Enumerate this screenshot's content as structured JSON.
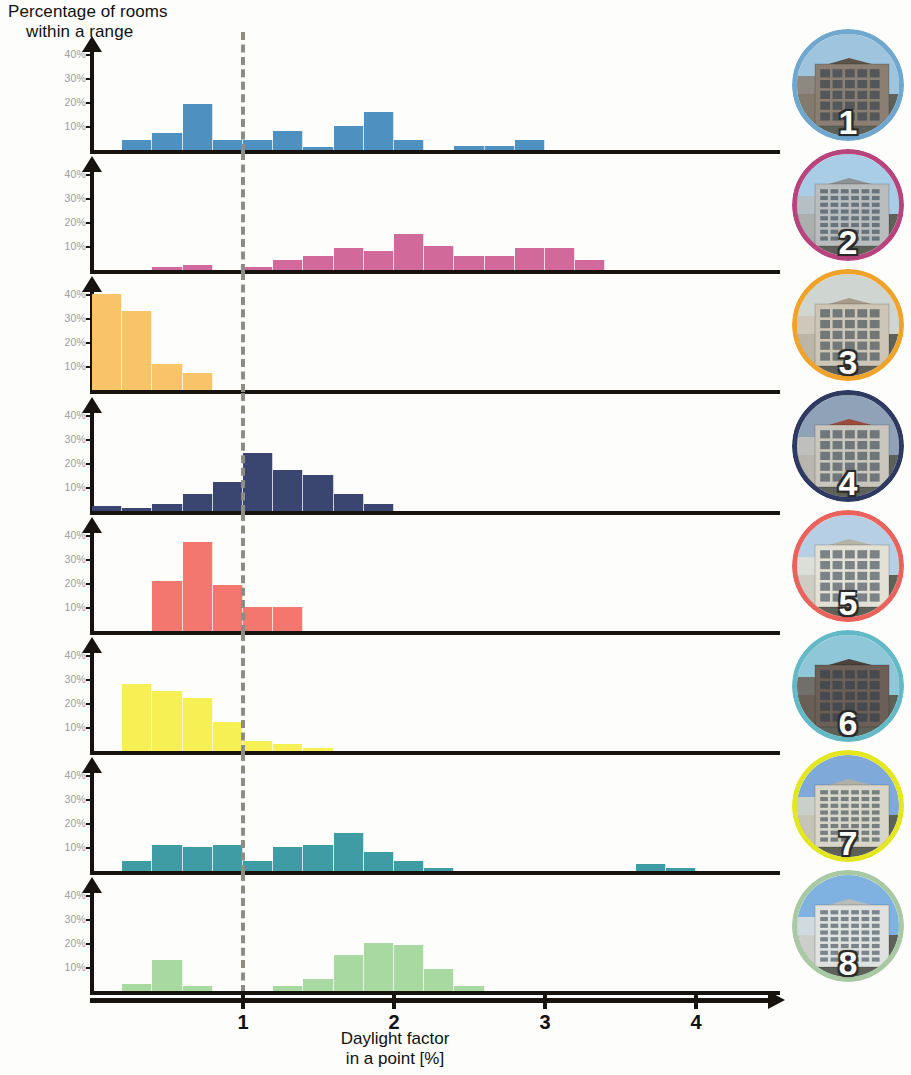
{
  "figure": {
    "y_axis_title_line1": "Percentage of rooms",
    "y_axis_title_line2": "within a range",
    "x_axis_title_line1": "Daylight factor",
    "x_axis_title_line2": "in a point [%]"
  },
  "chart_data": {
    "type": "bar",
    "xlabel": "Daylight factor in a point [%]",
    "ylabel": "Percentage of rooms within a range",
    "xlim": [
      0,
      4.4
    ],
    "ylim": [
      0,
      45
    ],
    "grid": false,
    "legend": "none",
    "bin_width": 0.2,
    "bin_starts": [
      0.0,
      0.2,
      0.4,
      0.6,
      0.8,
      1.0,
      1.2,
      1.4,
      1.6,
      1.8,
      2.0,
      2.2,
      2.4,
      2.6,
      2.8,
      3.0,
      3.2,
      3.4,
      3.6,
      3.8,
      4.0
    ],
    "y_ticks": [
      "10%",
      "20%",
      "30%",
      "40%"
    ],
    "y_tick_values": [
      10,
      20,
      30,
      40
    ],
    "x_ticks": [
      "1",
      "2",
      "3",
      "4"
    ],
    "x_tick_values": [
      1,
      2,
      3,
      4
    ],
    "reference_line": {
      "x": 1.0,
      "style": "dashed",
      "color": "#8d8d86",
      "label": ""
    },
    "panels": [
      {
        "id": 1,
        "number": "1",
        "color": "#4e90bf",
        "ring_color": "#6fa7cf",
        "values": [
          0,
          4,
          7,
          19,
          4,
          4,
          8,
          1,
          10,
          16,
          4,
          0,
          1.5,
          1.5,
          4,
          0,
          0,
          0,
          0,
          0,
          0
        ]
      },
      {
        "id": 2,
        "number": "2",
        "color": "#d1699b",
        "ring_color": "#b8447e",
        "values": [
          0,
          0,
          1,
          2,
          0,
          1,
          4,
          6,
          9,
          8,
          15,
          10,
          6,
          6,
          9,
          9,
          4,
          0,
          0,
          0,
          0
        ]
      },
      {
        "id": 3,
        "number": "3",
        "color": "#f9c469",
        "ring_color": "#f0a32a",
        "values": [
          40,
          33,
          11,
          7,
          0,
          0,
          0,
          0,
          0,
          0,
          0,
          0,
          0,
          0,
          0,
          0,
          0,
          0,
          0,
          0,
          0
        ]
      },
      {
        "id": 4,
        "number": "4",
        "color": "#3b4670",
        "ring_color": "#2f3a63",
        "values": [
          2,
          1,
          3,
          7,
          12,
          24,
          17,
          15,
          7,
          3,
          0,
          0,
          0,
          0,
          0,
          0,
          0,
          0,
          0,
          0,
          0
        ]
      },
      {
        "id": 5,
        "number": "5",
        "color": "#f4776f",
        "ring_color": "#e9625c",
        "values": [
          0,
          0,
          21,
          37,
          19,
          10,
          10,
          0,
          0,
          0,
          0,
          0,
          0,
          0,
          0,
          0,
          0,
          0,
          0,
          0,
          0
        ]
      },
      {
        "id": 6,
        "number": "6",
        "color": "#f6f055",
        "ring_color": "#63b9c6",
        "values": [
          0,
          28,
          25,
          22,
          12,
          4,
          3,
          1,
          0,
          0,
          0,
          0,
          0,
          0,
          0,
          0,
          0,
          0,
          0,
          0,
          0
        ]
      },
      {
        "id": 7,
        "number": "7",
        "color": "#3f9ba4",
        "ring_color": "#e4e620",
        "values": [
          0,
          4,
          11,
          10,
          11,
          4,
          10,
          11,
          16,
          8,
          4,
          1,
          0,
          0,
          0,
          0,
          0,
          0,
          3,
          1,
          0
        ]
      },
      {
        "id": 8,
        "number": "8",
        "color": "#a8d9a0",
        "ring_color": "#a8c9a4",
        "values": [
          0,
          3,
          13,
          2,
          0,
          0,
          2,
          5,
          15,
          20,
          19,
          9,
          2,
          0,
          0,
          0,
          0,
          0,
          0,
          0,
          0
        ]
      }
    ]
  }
}
